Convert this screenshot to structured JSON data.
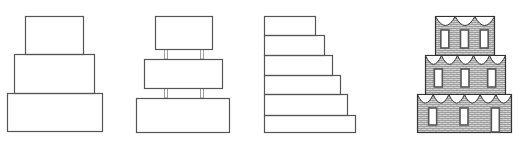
{
  "diagram": {
    "stroke_color": "#555555",
    "fill_texture_color": "#9a9a9a",
    "figures": [
      {
        "name": "stacked-three-tier",
        "tiers": [
          {
            "x": 25,
            "y": 16,
            "w": 58,
            "h": 38
          },
          {
            "x": 14,
            "y": 54,
            "w": 80,
            "h": 39
          },
          {
            "x": 7,
            "y": 93,
            "w": 95,
            "h": 38
          }
        ]
      },
      {
        "name": "separated-three-tier-with-pillars",
        "tiers": [
          {
            "x": 155,
            "y": 16,
            "w": 57,
            "h": 33
          },
          {
            "x": 144,
            "y": 59,
            "w": 78,
            "h": 29
          },
          {
            "x": 136,
            "y": 98,
            "w": 93,
            "h": 34
          }
        ],
        "pillars": [
          {
            "x": 164,
            "y": 49,
            "w": 3,
            "h": 10
          },
          {
            "x": 200,
            "y": 49,
            "w": 3,
            "h": 10
          },
          {
            "x": 164,
            "y": 88,
            "w": 3,
            "h": 10
          },
          {
            "x": 200,
            "y": 88,
            "w": 3,
            "h": 10
          }
        ]
      },
      {
        "name": "staircase-six-step",
        "left_x": 264,
        "steps": [
          {
            "y": 16,
            "h": 19,
            "right": 315
          },
          {
            "y": 35,
            "h": 20,
            "right": 324
          },
          {
            "y": 55,
            "h": 20,
            "right": 332
          },
          {
            "y": 75,
            "h": 19,
            "right": 340
          },
          {
            "y": 94,
            "h": 21,
            "right": 347
          },
          {
            "y": 115,
            "h": 17,
            "right": 355
          }
        ]
      },
      {
        "name": "decorated-brick-three-tier",
        "tiers": [
          {
            "x": 435,
            "y": 16,
            "w": 59,
            "h": 39,
            "scallops": 3,
            "windows": 3,
            "door": false
          },
          {
            "x": 425,
            "y": 55,
            "w": 80,
            "h": 39,
            "scallops": 5,
            "windows": 3,
            "door": false
          },
          {
            "x": 417,
            "y": 94,
            "w": 94,
            "h": 38,
            "scallops": 6,
            "windows": 2,
            "door": true
          }
        ]
      }
    ]
  }
}
